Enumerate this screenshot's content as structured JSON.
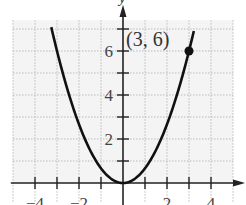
{
  "chart_data": {
    "type": "line",
    "title": "",
    "function": "y = (2/3)x^2",
    "xlabel": "x",
    "ylabel": "y",
    "xlim": [
      -5,
      5
    ],
    "ylim": [
      -0.9,
      7.4
    ],
    "grid": true,
    "x_ticks": [
      -4,
      -3,
      -2,
      -1,
      1,
      2,
      3,
      4
    ],
    "x_tick_labels": [
      "-4",
      "-2",
      "2",
      "4"
    ],
    "y_ticks": [
      1,
      2,
      3,
      4,
      5,
      6,
      7
    ],
    "y_tick_labels": [
      "2",
      "4",
      "6"
    ],
    "series": [
      {
        "name": "parabola",
        "x": [
          -3.25,
          -3,
          -2.5,
          -2,
          -1.5,
          -1,
          -0.5,
          0,
          0.5,
          1,
          1.5,
          2,
          2.5,
          3,
          3.25
        ],
        "y": [
          7.04,
          6,
          4.17,
          2.67,
          1.5,
          0.67,
          0.17,
          0,
          0.17,
          0.67,
          1.5,
          2.67,
          4.17,
          6,
          7.04
        ]
      }
    ],
    "annotations": [
      {
        "point": [
          3,
          6
        ],
        "label": "(3, 6)",
        "marker": "filled-circle"
      }
    ],
    "colors": {
      "curve": "#111111",
      "grid": "#bbbbbb",
      "axis": "#222222",
      "background": "#f4f4f4"
    }
  }
}
